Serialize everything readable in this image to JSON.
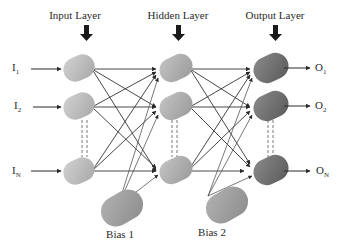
{
  "diagram": {
    "type": "feed-forward neural network",
    "layers": [
      {
        "id": "input",
        "title": "Input Layer",
        "node_color": "#b4b4b4",
        "nodes": [
          "I1",
          "I2",
          "IN"
        ]
      },
      {
        "id": "hidden",
        "title": "Hidden Layer",
        "node_color": "#a6a6a6",
        "nodes": [
          "H1",
          "H2",
          "HN"
        ]
      },
      {
        "id": "output",
        "title": "Output Layer",
        "node_color": "#6e6e6e",
        "nodes": [
          "O1",
          "O2",
          "ON"
        ]
      }
    ],
    "inputs": [
      {
        "base": "I",
        "sub": "1"
      },
      {
        "base": "I",
        "sub": "2"
      },
      {
        "base": "I",
        "sub": "N"
      }
    ],
    "outputs": [
      {
        "base": "O",
        "sub": "1"
      },
      {
        "base": "O",
        "sub": "2"
      },
      {
        "base": "O",
        "sub": "N"
      }
    ],
    "biases": [
      {
        "label": "Bias 1",
        "connects_to": "hidden",
        "node_color": "#9a9a9a"
      },
      {
        "label": "Bias 2",
        "connects_to": "output",
        "node_color": "#9a9a9a"
      }
    ],
    "edge_color": "#333333",
    "ellipsis_style": "dashed vertical lines between node 2 and node N"
  }
}
